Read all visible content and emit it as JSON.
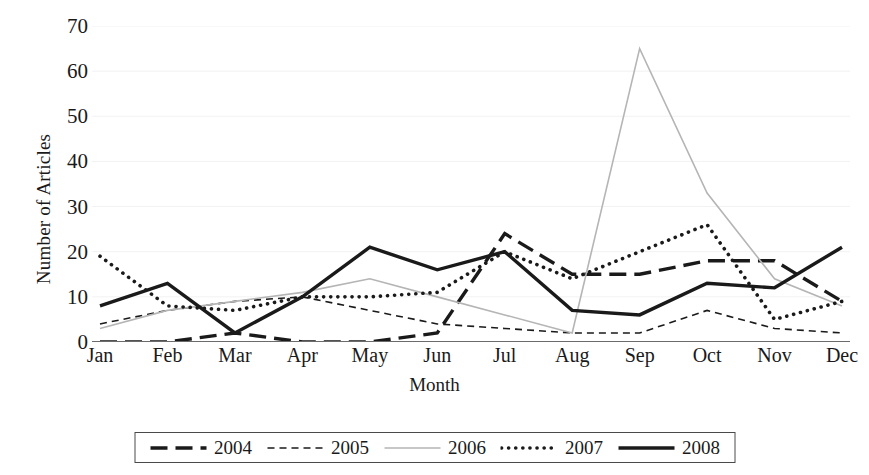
{
  "chart_data": {
    "type": "line",
    "title": "",
    "xlabel": "Month",
    "ylabel": "Number of Articles",
    "categories": [
      "Jan",
      "Feb",
      "Mar",
      "Apr",
      "May",
      "Jun",
      "Jul",
      "Aug",
      "Sep",
      "Oct",
      "Nov",
      "Dec"
    ],
    "ylim": [
      0,
      70
    ],
    "yticks": [
      0,
      10,
      20,
      30,
      40,
      50,
      60,
      70
    ],
    "grid": true,
    "legend_position": "bottom",
    "series": [
      {
        "name": "2004",
        "style": "long-dash",
        "color": "#1a1a1a",
        "width": 3.4,
        "dash": "17,8",
        "values": [
          0,
          0,
          2,
          0,
          0,
          2,
          24,
          15,
          15,
          18,
          18,
          9
        ]
      },
      {
        "name": "2005",
        "style": "short-dash",
        "color": "#1a1a1a",
        "width": 1.6,
        "dash": "7,5",
        "values": [
          4,
          7,
          9,
          10,
          7,
          4,
          3,
          2,
          2,
          7,
          3,
          2
        ]
      },
      {
        "name": "2006",
        "style": "thin-solid",
        "color": "#b5b5b5",
        "width": 1.6,
        "dash": "",
        "values": [
          3,
          7,
          9,
          11,
          14,
          10,
          6,
          2,
          65,
          33,
          14,
          8
        ]
      },
      {
        "name": "2007",
        "style": "dotted",
        "color": "#1a1a1a",
        "width": 3.6,
        "dash": "0.1,7",
        "values": [
          19,
          8,
          7,
          10,
          10,
          11,
          20,
          14,
          20,
          26,
          5,
          9
        ]
      },
      {
        "name": "2008",
        "style": "thick-solid",
        "color": "#1a1a1a",
        "width": 3.4,
        "dash": "",
        "values": [
          8,
          13,
          2,
          10,
          21,
          16,
          20,
          7,
          6,
          13,
          12,
          21
        ]
      }
    ]
  }
}
